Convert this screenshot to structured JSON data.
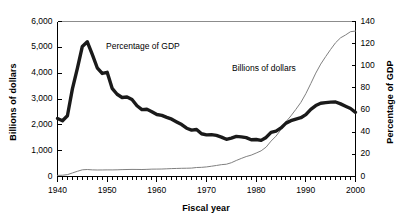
{
  "chart_data": {
    "type": "line",
    "title": "",
    "xlabel": "Fiscal year",
    "ylabel": "Billions of dollars",
    "ylabel_right": "Percentage of GDP",
    "grid": false,
    "legend_position": "inline-annotations",
    "xlim": [
      1940,
      2000
    ],
    "ylim": [
      0,
      6000
    ],
    "ylim_right": [
      0,
      140
    ],
    "xticks": [
      1940,
      1950,
      1960,
      1970,
      1980,
      1990,
      2000
    ],
    "xtick_labels": [
      "1940",
      "1950",
      "1960",
      "1970",
      "1980",
      "1990",
      "2000"
    ],
    "xminor_tick_interval": 1,
    "yticks": [
      0,
      1000,
      2000,
      3000,
      4000,
      5000,
      6000
    ],
    "ytick_labels": [
      "0",
      "1,000",
      "2,000",
      "3,000",
      "4,000",
      "5,000",
      "6,000"
    ],
    "yticks_right": [
      0,
      20,
      40,
      60,
      80,
      100,
      120,
      140
    ],
    "ytick_labels_right": [
      "0",
      "20",
      "40",
      "60",
      "80",
      "100",
      "120",
      "140"
    ],
    "x": [
      1940,
      1941,
      1942,
      1943,
      1944,
      1945,
      1946,
      1947,
      1948,
      1949,
      1950,
      1951,
      1952,
      1953,
      1954,
      1955,
      1956,
      1957,
      1958,
      1959,
      1960,
      1961,
      1962,
      1963,
      1964,
      1965,
      1966,
      1967,
      1968,
      1969,
      1970,
      1971,
      1972,
      1973,
      1974,
      1975,
      1976,
      1977,
      1978,
      1979,
      1980,
      1981,
      1982,
      1983,
      1984,
      1985,
      1986,
      1987,
      1988,
      1989,
      1990,
      1991,
      1992,
      1993,
      1994,
      1995,
      1996,
      1997,
      1998,
      1999,
      2000
    ],
    "series": [
      {
        "name": "Percentage of GDP",
        "axis": "right",
        "units": "percent of GDP",
        "style": "thick-line",
        "color": "#1a1a1a",
        "annotation": "Percentage of GDP",
        "values": [
          52.4,
          50.4,
          54.9,
          79.1,
          97.6,
          117.5,
          121.7,
          110.3,
          98.2,
          93.1,
          94.1,
          79.6,
          74.3,
          71.4,
          71.8,
          69.5,
          63.9,
          60.4,
          60.7,
          58.5,
          56.0,
          55.2,
          53.4,
          51.8,
          49.3,
          46.9,
          43.6,
          41.9,
          42.5,
          38.6,
          37.6,
          37.8,
          37.1,
          35.6,
          33.6,
          34.7,
          36.2,
          35.8,
          35.1,
          33.2,
          33.4,
          32.6,
          35.3,
          39.9,
          41.0,
          43.9,
          48.2,
          50.4,
          51.9,
          53.1,
          55.9,
          60.7,
          64.1,
          66.2,
          66.7,
          67.2,
          67.3,
          65.6,
          63.5,
          61.4,
          58.0
        ]
      },
      {
        "name": "Billions of dollars",
        "axis": "left",
        "units": "billions of dollars",
        "style": "thin-line",
        "color": "#808080",
        "annotation": "Billions of dollars",
        "values": [
          43,
          49,
          72,
          137,
          201,
          259,
          271,
          257,
          252,
          253,
          257,
          255,
          259,
          266,
          271,
          274,
          273,
          271,
          276,
          285,
          287,
          289,
          298,
          306,
          312,
          317,
          320,
          326,
          348,
          354,
          371,
          398,
          427,
          458,
          475,
          533,
          620,
          699,
          772,
          827,
          908,
          994,
          1137,
          1371,
          1564,
          1817,
          2120,
          2346,
          2601,
          2868,
          3206,
          3598,
          4002,
          4351,
          4643,
          4921,
          5181,
          5369,
          5478,
          5606,
          5629
        ]
      }
    ]
  },
  "axes": {
    "x_title": "Fiscal year",
    "y_left_title": "Billions of dollars",
    "y_right_title": "Percentage of GDP"
  },
  "annotations": {
    "pct_label": "Percentage of GDP",
    "dollars_label": "Billions of dollars"
  },
  "colors": {
    "axis": "#000000",
    "thick_series": "#1a1a1a",
    "thin_series": "#808080",
    "background": "#ffffff"
  }
}
